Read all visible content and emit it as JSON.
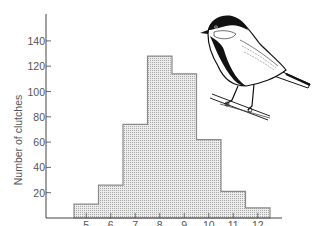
{
  "chart_data": {
    "type": "bar",
    "title": "",
    "xlabel": "",
    "ylabel": "Number of clutches",
    "categories": [
      "5",
      "6",
      "7",
      "8",
      "9",
      "10",
      "11",
      "12"
    ],
    "values": [
      11,
      26,
      74,
      128,
      114,
      62,
      21,
      8
    ],
    "ylim": [
      0,
      160
    ],
    "yticks": [
      20,
      40,
      60,
      80,
      100,
      120,
      140
    ],
    "grid": false,
    "legend": null,
    "style": "histogram with dotted fill, bars adjacent",
    "annotation": "illustration of a great tit perched on a branch (top right)"
  },
  "colors": {
    "bar_fill": "#e4e4e4",
    "bar_dots": "#9a9a9a",
    "bar_edge": "#8a8a8a",
    "axis": "#444444",
    "text": "#555555"
  }
}
